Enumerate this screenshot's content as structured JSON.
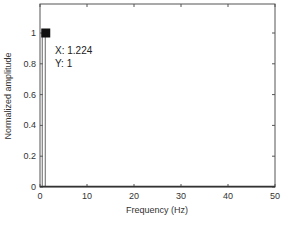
{
  "chart_data": {
    "type": "line",
    "title": "",
    "xlabel": "Frequency (Hz)",
    "ylabel": "Normalized amplitude",
    "xlim": [
      0,
      50
    ],
    "ylim": [
      0,
      1.2
    ],
    "xticks": [
      0,
      10,
      20,
      30,
      40,
      50
    ],
    "yticks": [
      0,
      0.2,
      0.4,
      0.6,
      0.8,
      1
    ],
    "xtick_labels": [
      "0",
      "10",
      "20",
      "30",
      "40",
      "50"
    ],
    "ytick_labels": [
      "0",
      "0.2",
      "0.4",
      "0.6",
      "0.8",
      "1"
    ],
    "grid": false,
    "legend": null,
    "series": [
      {
        "name": "spectrum",
        "x": [
          0,
          0.5,
          1.0,
          1.224,
          1.5,
          2.0,
          50
        ],
        "y": [
          0,
          0,
          0.0,
          1.0,
          0.0,
          0,
          0
        ]
      }
    ],
    "annotations": [
      {
        "type": "datatip",
        "x": 1.224,
        "y": 1,
        "text_x": "X: 1.224",
        "text_y": "Y: 1"
      }
    ]
  },
  "datatip": {
    "x_text": "X: 1.224",
    "y_text": "Y: 1"
  },
  "axes": {
    "xlabel": "Frequency (Hz)",
    "ylabel": "Normalized amplitude"
  }
}
